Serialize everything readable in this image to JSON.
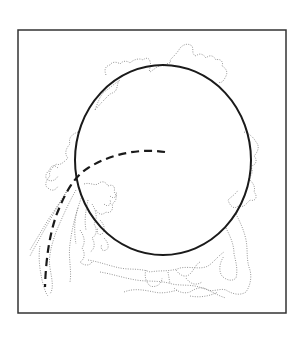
{
  "figure": {
    "background": "#ffffff",
    "frame": {
      "x": 18,
      "y": 30,
      "width": 268,
      "height": 283,
      "stroke": "#333333",
      "stroke_width": 1.5
    },
    "ellipse": {
      "cx": 163,
      "cy": 160,
      "rx": 88,
      "ry": 95,
      "stroke": "#1a1a1a",
      "stroke_width": 2
    },
    "dashed_curve": {
      "stroke": "#1a1a1a",
      "stroke_width": 2.2,
      "dash": "8,5"
    },
    "dotted_contour": {
      "stroke": "#8a8a8a",
      "stroke_width": 0.9,
      "dash": "1,1.4"
    }
  }
}
